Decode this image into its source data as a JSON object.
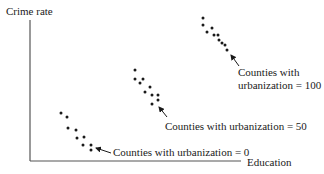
{
  "diagram": {
    "y_axis_label": "Crime rate",
    "x_axis_label": "Education",
    "colors": {
      "ink": "#1a1a1a",
      "axis": "#555555",
      "background": "#ffffff"
    },
    "groups": [
      {
        "label_line1": "Counties with",
        "label_line2": "urbanization = 100",
        "urbanization": 100,
        "points": [
          [
            203,
            18
          ],
          [
            203,
            25
          ],
          [
            212,
            28
          ],
          [
            207,
            32
          ],
          [
            214,
            35
          ],
          [
            218,
            35
          ],
          [
            219,
            40
          ],
          [
            222,
            43
          ],
          [
            225,
            45
          ],
          [
            227,
            50
          ]
        ]
      },
      {
        "label": "Counties with urbanization = 50",
        "urbanization": 50,
        "points": [
          [
            135,
            70
          ],
          [
            135,
            79
          ],
          [
            143,
            79
          ],
          [
            140,
            83
          ],
          [
            150,
            87
          ],
          [
            145,
            92
          ],
          [
            152,
            95
          ],
          [
            158,
            95
          ],
          [
            158,
            100
          ],
          [
            152,
            104
          ]
        ]
      },
      {
        "label": "Counties with urbanization = 0",
        "urbanization": 0,
        "points": [
          [
            61,
            113
          ],
          [
            67,
            117
          ],
          [
            68,
            128
          ],
          [
            76,
            130
          ],
          [
            77,
            138
          ],
          [
            84,
            137
          ],
          [
            83,
            145
          ],
          [
            91,
            145
          ],
          [
            91,
            150
          ]
        ]
      }
    ]
  }
}
